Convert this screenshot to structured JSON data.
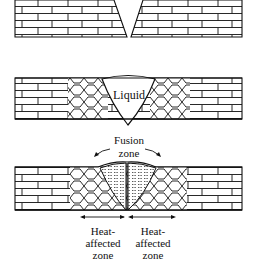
{
  "diagram": {
    "stages": [
      {
        "name": "joint-preparation",
        "label": ""
      },
      {
        "name": "molten-pool",
        "label": "Liquid"
      },
      {
        "name": "solidified-weld",
        "label": ""
      }
    ],
    "labels": {
      "liquid": "Liquid",
      "fusion_zone_line1": "Fusion",
      "fusion_zone_line2": "zone",
      "haz_left_line1": "Heat-",
      "haz_left_line2": "affected",
      "haz_left_line3": "zone",
      "haz_right_line1": "Heat-",
      "haz_right_line2": "affected",
      "haz_right_line3": "zone"
    },
    "colors": {
      "ink": "#111111",
      "background": "#ffffff"
    }
  }
}
